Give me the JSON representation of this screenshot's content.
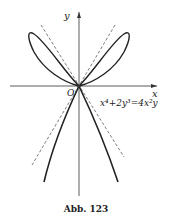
{
  "figure": {
    "axis_x_label": "x",
    "axis_y_label": "y",
    "origin_label": "O",
    "equation": "x⁴+2y³=4x²y",
    "caption": "Abb. 123"
  }
}
